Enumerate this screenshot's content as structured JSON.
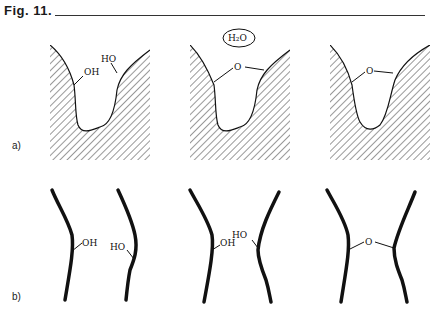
{
  "figure": {
    "title": "Fig. 11.",
    "water_label": "H₂O",
    "row_a_label": "a)",
    "row_b_label": "b)",
    "panels_a": [
      {
        "left_group": "OH",
        "right_group": "HO"
      },
      {
        "bridge": "O"
      },
      {
        "bridge": "O"
      }
    ],
    "panels_b": [
      {
        "left_group": "OH",
        "right_group": "HO"
      },
      {
        "left_group": "OH",
        "right_group": "HO"
      },
      {
        "bridge": "O"
      }
    ]
  }
}
